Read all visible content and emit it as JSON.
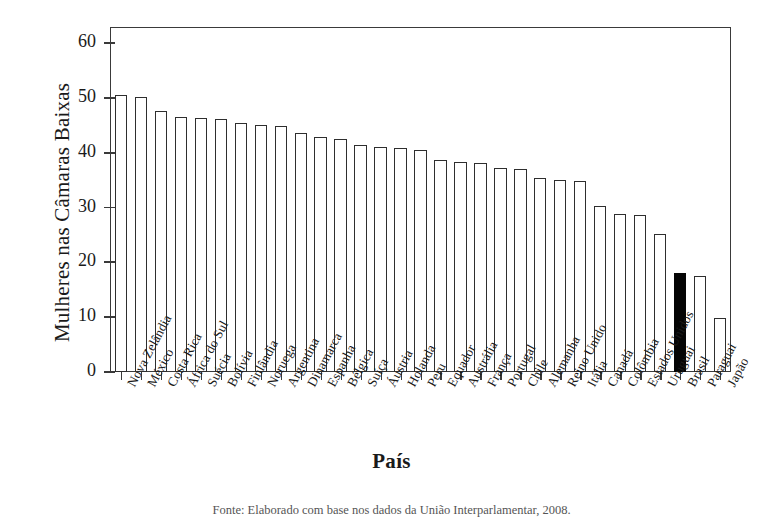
{
  "chart_data": {
    "type": "bar",
    "title": "",
    "xlabel": "País",
    "ylabel": "Mulheres nas Câmaras Baixas",
    "ylim": [
      0,
      63
    ],
    "yticks": [
      0,
      10,
      20,
      30,
      40,
      50,
      60
    ],
    "grid": false,
    "legend": "none",
    "highlight_category": "Brasil",
    "highlight_color": "#050505",
    "bar_color": "#ffffff",
    "bar_edge_color": "#2e2e2e",
    "categories": [
      "Nova Zelândia",
      "México",
      "Costa Rica",
      "África do Sul",
      "Suécia",
      "Bolívia",
      "Finlândia",
      "Noruega",
      "Argentina",
      "Dinamarca",
      "Espanha",
      "Bélgica",
      "Suíça",
      "Áustria",
      "Holanda",
      "Peru",
      "Equador",
      "Austrália",
      "França",
      "Portugal",
      "Chile",
      "Alemanha",
      "Reino Unido",
      "Itália",
      "Canadá",
      "Colômbia",
      "Estados Unidos",
      "Uruguai",
      "Brasil",
      "Paraguai",
      "Japão"
    ],
    "values": [
      50.5,
      50.2,
      47.6,
      46.5,
      46.3,
      46.2,
      45.4,
      45.1,
      44.9,
      43.6,
      43.0,
      42.6,
      41.5,
      41.0,
      40.9,
      40.5,
      38.8,
      38.4,
      38.2,
      37.2,
      37.0,
      35.4,
      35.1,
      34.8,
      30.4,
      28.9,
      28.6,
      25.2,
      18.1,
      17.6,
      9.9
    ]
  },
  "footer": {
    "source": "Fonte: Elaborado com base nos dados da União Interparlamentar, 2008."
  }
}
